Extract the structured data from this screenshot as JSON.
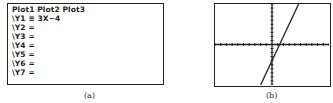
{
  "panel_a": {
    "header": "Plot1 Plot2 Plot3",
    "lines": [
      "\\Y1 ≡ 3X−4",
      "\\Y2 =",
      "\\Y3 =",
      "\\Y4 =",
      "\\Y5 =",
      "\\Y6 =",
      "\\Y7 ="
    ],
    "caption": "(a)"
  },
  "panel_b": {
    "caption": "(b)"
  },
  "chart_data": {
    "type": "line",
    "title": "",
    "series": [
      {
        "name": "Y1",
        "equation": "y = 3x - 4",
        "points": [
          [
            -2,
            -10
          ],
          [
            4.67,
            10
          ]
        ]
      }
    ],
    "xlim": [
      -10,
      10
    ],
    "ylim": [
      -10,
      10
    ],
    "xlabel": "",
    "ylabel": "",
    "grid": false,
    "tick_spacing": 1,
    "x_intercept": 1.33,
    "y_intercept": -4
  }
}
